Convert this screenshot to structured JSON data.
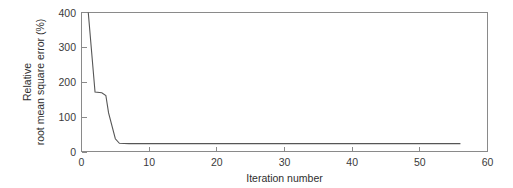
{
  "chart_data": {
    "type": "line",
    "title": "",
    "xlabel": "Iteration number",
    "ylabel": "Relative\nroot mean square error (%)",
    "ylabel_line1": "Relative",
    "ylabel_line2": "root mean square error (%)",
    "xlim": [
      0,
      60
    ],
    "ylim": [
      0,
      400
    ],
    "xticks": [
      0,
      10,
      20,
      30,
      40,
      50,
      60
    ],
    "xticklabels": [
      "0",
      "10",
      "20",
      "30",
      "40",
      "50",
      "60"
    ],
    "yticks": [
      0,
      100,
      200,
      300,
      400
    ],
    "yticklabels": [
      "0",
      "100",
      "200",
      "300",
      "400"
    ],
    "grid": false,
    "legend": null,
    "line_color": "#565656",
    "axis_color": "#8a8a8a",
    "background_color": "#ffffff",
    "series": [
      {
        "name": "Relative RMSE",
        "x": [
          1,
          2,
          3,
          3.6,
          4,
          5,
          5.6,
          7,
          10,
          15,
          20,
          25,
          30,
          35,
          40,
          45,
          50,
          54,
          56
        ],
        "values": [
          400,
          172,
          170,
          162,
          112,
          38,
          25,
          24,
          24,
          24,
          24,
          24,
          24,
          24,
          24,
          24,
          24,
          24,
          24
        ]
      }
    ]
  },
  "axes": {
    "x_axis_name": "iteration-number-axis",
    "y_axis_name": "relative-rmse-axis"
  }
}
